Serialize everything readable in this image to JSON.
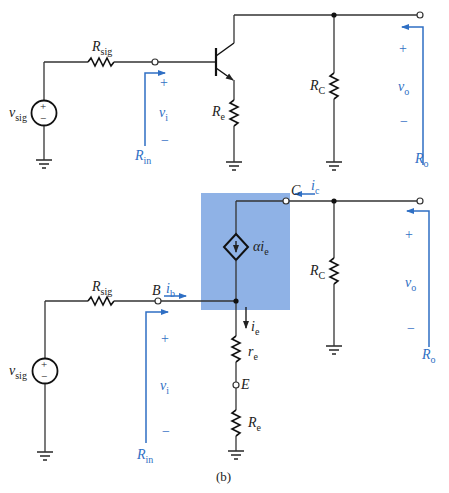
{
  "figure": {
    "caption": "(b)",
    "colors": {
      "wire": "#333333",
      "annotation": "#2f6fc4",
      "model_box": "#8fb2e6"
    }
  },
  "top_circuit": {
    "source": {
      "symbol": "v",
      "sub": "sig",
      "plus": "+",
      "minus": "−"
    },
    "rsig": {
      "symbol": "R",
      "sub": "sig"
    },
    "re": {
      "symbol": "R",
      "sub": "e"
    },
    "rc": {
      "symbol": "R",
      "sub": "C"
    },
    "vi": {
      "symbol": "v",
      "sub": "i",
      "plus": "+",
      "minus": "−"
    },
    "vo": {
      "symbol": "v",
      "sub": "o",
      "plus": "+",
      "minus": "−"
    },
    "rin": {
      "symbol": "R",
      "sub": "in"
    },
    "ro": {
      "symbol": "R",
      "sub": "o"
    }
  },
  "bottom_circuit": {
    "source": {
      "symbol": "v",
      "sub": "sig",
      "plus": "+",
      "minus": "−"
    },
    "rsig": {
      "symbol": "R",
      "sub": "sig"
    },
    "node_b": "B",
    "node_c": "C",
    "node_e": "E",
    "ib": {
      "symbol": "i",
      "sub": "b"
    },
    "ic": {
      "symbol": "i",
      "sub": "c"
    },
    "ie": {
      "symbol": "i",
      "sub": "e"
    },
    "dependent_source": {
      "symbol": "αi",
      "sub": "e"
    },
    "re_small": {
      "symbol": "r",
      "sub": "e"
    },
    "re": {
      "symbol": "R",
      "sub": "e"
    },
    "rc": {
      "symbol": "R",
      "sub": "C"
    },
    "vi": {
      "symbol": "v",
      "sub": "i",
      "plus": "+",
      "minus": "−"
    },
    "vo": {
      "symbol": "v",
      "sub": "o",
      "plus": "+",
      "minus": "−"
    },
    "rin": {
      "symbol": "R",
      "sub": "in"
    },
    "ro": {
      "symbol": "R",
      "sub": "o"
    }
  }
}
